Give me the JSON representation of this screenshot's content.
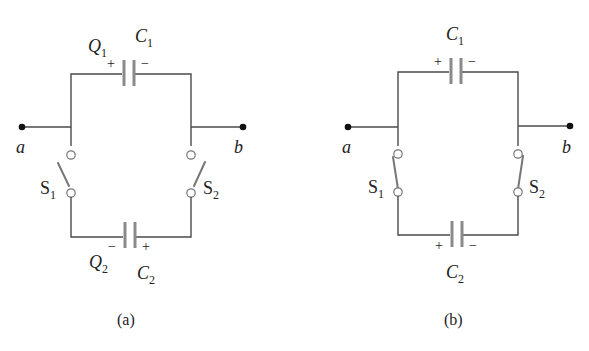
{
  "figure": {
    "panels": [
      {
        "caption": "(a)",
        "terminals": {
          "left": "a",
          "right": "b"
        },
        "capacitor_top": {
          "name": "C",
          "sub": "1",
          "charge": "Q",
          "charge_sub": "1",
          "left_sign": "+",
          "right_sign": "−"
        },
        "capacitor_bottom": {
          "name": "C",
          "sub": "2",
          "charge": "Q",
          "charge_sub": "2",
          "left_sign": "−",
          "right_sign": "+"
        },
        "switch_left": {
          "name": "S",
          "sub": "1",
          "state": "open"
        },
        "switch_right": {
          "name": "S",
          "sub": "2",
          "state": "open"
        }
      },
      {
        "caption": "(b)",
        "terminals": {
          "left": "a",
          "right": "b"
        },
        "capacitor_top": {
          "name": "C",
          "sub": "1",
          "left_sign": "+",
          "right_sign": "−"
        },
        "capacitor_bottom": {
          "name": "C",
          "sub": "2",
          "left_sign": "+",
          "right_sign": "−"
        },
        "switch_left": {
          "name": "S",
          "sub": "1",
          "state": "closed"
        },
        "switch_right": {
          "name": "S",
          "sub": "2",
          "state": "closed"
        }
      }
    ]
  }
}
